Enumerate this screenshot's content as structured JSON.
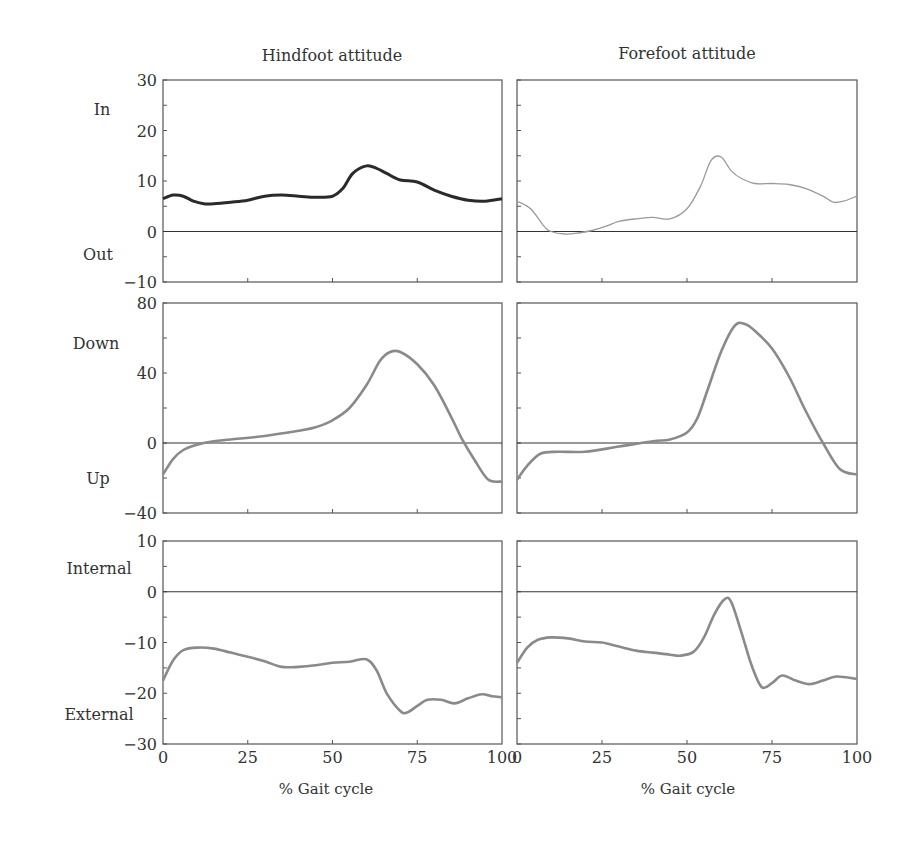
{
  "figure": {
    "column_titles": [
      "Hindfoot attitude",
      "Forefoot attitude"
    ],
    "xlabel": "% Gait cycle",
    "x_ticks": [
      0,
      25,
      50,
      75,
      100
    ],
    "colors": {
      "axis": "#555555",
      "hindfoot_inout_line": "#2a2a2a",
      "forefoot_inout_line": "#9a9a9a",
      "curve": "#8a8a8a"
    }
  },
  "chart_data": [
    {
      "type": "line",
      "title": "Hindfoot attitude",
      "panel": "row1-col1",
      "xlabel": "",
      "ylabel": "In / Out",
      "direction_labels": {
        "positive": "In",
        "negative": "Out"
      },
      "xlim": [
        0,
        100
      ],
      "ylim": [
        -10,
        30
      ],
      "y_ticks": [
        -10,
        0,
        10,
        20,
        30
      ],
      "x": [
        0,
        3,
        6,
        9,
        12,
        15,
        20,
        25,
        30,
        35,
        40,
        45,
        50,
        53,
        56,
        60,
        63,
        66,
        70,
        75,
        80,
        85,
        90,
        95,
        100
      ],
      "y": [
        6.5,
        7.2,
        7.0,
        6.0,
        5.5,
        5.5,
        5.8,
        6.2,
        7.0,
        7.2,
        7.0,
        6.8,
        7.0,
        8.5,
        11.5,
        13.0,
        12.5,
        11.5,
        10.2,
        9.8,
        8.2,
        7.0,
        6.2,
        6.0,
        6.5
      ]
    },
    {
      "type": "line",
      "title": "Forefoot attitude",
      "panel": "row1-col2",
      "xlabel": "",
      "ylabel": "In / Out",
      "direction_labels": {
        "positive": "In",
        "negative": "Out"
      },
      "xlim": [
        0,
        100
      ],
      "ylim": [
        -10,
        30
      ],
      "y_ticks": [
        -10,
        0,
        10,
        20,
        30
      ],
      "x": [
        0,
        4,
        8,
        10,
        14,
        18,
        22,
        26,
        30,
        35,
        40,
        45,
        50,
        54,
        57,
        60,
        63,
        66,
        70,
        75,
        80,
        85,
        90,
        93,
        96,
        100
      ],
      "y": [
        6.0,
        4.5,
        1.0,
        0.0,
        -0.5,
        -0.3,
        0.2,
        1.0,
        2.0,
        2.5,
        2.8,
        2.5,
        4.5,
        9.0,
        14.0,
        14.8,
        12.0,
        10.5,
        9.5,
        9.5,
        9.3,
        8.5,
        7.0,
        5.8,
        6.0,
        7.0
      ]
    },
    {
      "type": "line",
      "title": "Hindfoot attitude",
      "panel": "row2-col1",
      "xlabel": "",
      "ylabel": "Down / Up",
      "direction_labels": {
        "positive": "Down",
        "negative": "Up"
      },
      "xlim": [
        0,
        100
      ],
      "ylim": [
        -40,
        80
      ],
      "y_ticks": [
        -40,
        0,
        40,
        80
      ],
      "x": [
        0,
        3,
        6,
        10,
        15,
        20,
        30,
        40,
        45,
        50,
        55,
        60,
        64,
        67,
        70,
        75,
        80,
        85,
        88,
        92,
        96,
        100
      ],
      "y": [
        -18,
        -9,
        -4,
        -1,
        1,
        2,
        4,
        7,
        9,
        13,
        20,
        33,
        47,
        52,
        52,
        45,
        33,
        15,
        3,
        -10,
        -21,
        -22
      ]
    },
    {
      "type": "line",
      "title": "Forefoot attitude",
      "panel": "row2-col2",
      "xlabel": "",
      "ylabel": "Down / Up",
      "direction_labels": {
        "positive": "Down",
        "negative": "Up"
      },
      "xlim": [
        0,
        100
      ],
      "ylim": [
        -40,
        80
      ],
      "y_ticks": [
        -40,
        0,
        40,
        80
      ],
      "x": [
        0,
        3,
        7,
        12,
        20,
        30,
        40,
        45,
        50,
        53,
        56,
        60,
        64,
        67,
        70,
        75,
        80,
        85,
        90,
        95,
        100
      ],
      "y": [
        -21,
        -13,
        -6,
        -5,
        -5,
        -2,
        1,
        2,
        6,
        14,
        30,
        52,
        67,
        68,
        64,
        54,
        38,
        18,
        0,
        -15,
        -18
      ]
    },
    {
      "type": "line",
      "title": "Hindfoot attitude",
      "panel": "row3-col1",
      "xlabel": "% Gait cycle",
      "ylabel": "Internal / External",
      "direction_labels": {
        "positive": "Internal",
        "negative": "External"
      },
      "xlim": [
        0,
        100
      ],
      "ylim": [
        -30,
        10
      ],
      "y_ticks": [
        -30,
        -20,
        -10,
        0,
        10
      ],
      "x": [
        0,
        3,
        6,
        10,
        15,
        20,
        25,
        30,
        35,
        40,
        45,
        50,
        55,
        60,
        63,
        66,
        70,
        72,
        75,
        78,
        82,
        86,
        90,
        94,
        97,
        100
      ],
      "y": [
        -17.5,
        -13.5,
        -11.5,
        -11.0,
        -11.2,
        -12.0,
        -12.8,
        -13.7,
        -14.8,
        -14.8,
        -14.5,
        -14.0,
        -13.8,
        -13.3,
        -15.5,
        -20.0,
        -23.5,
        -23.8,
        -22.5,
        -21.3,
        -21.3,
        -22.0,
        -21.0,
        -20.2,
        -20.6,
        -20.8
      ]
    },
    {
      "type": "line",
      "title": "Forefoot attitude",
      "panel": "row3-col2",
      "xlabel": "% Gait cycle",
      "ylabel": "Internal / External",
      "direction_labels": {
        "positive": "Internal",
        "negative": "External"
      },
      "xlim": [
        0,
        100
      ],
      "ylim": [
        -30,
        10
      ],
      "y_ticks": [
        -30,
        -20,
        -10,
        0,
        10
      ],
      "x": [
        0,
        3,
        6,
        10,
        15,
        20,
        25,
        30,
        35,
        40,
        45,
        48,
        52,
        55,
        58,
        61,
        63,
        66,
        69,
        72,
        75,
        78,
        82,
        86,
        90,
        94,
        100
      ],
      "y": [
        -14.0,
        -11.0,
        -9.5,
        -9.0,
        -9.2,
        -9.8,
        -10.0,
        -10.8,
        -11.6,
        -12.0,
        -12.4,
        -12.6,
        -11.8,
        -9.0,
        -4.5,
        -1.5,
        -2.0,
        -8.0,
        -14.5,
        -18.8,
        -18.0,
        -16.5,
        -17.5,
        -18.2,
        -17.5,
        -16.7,
        -17.2
      ]
    }
  ]
}
